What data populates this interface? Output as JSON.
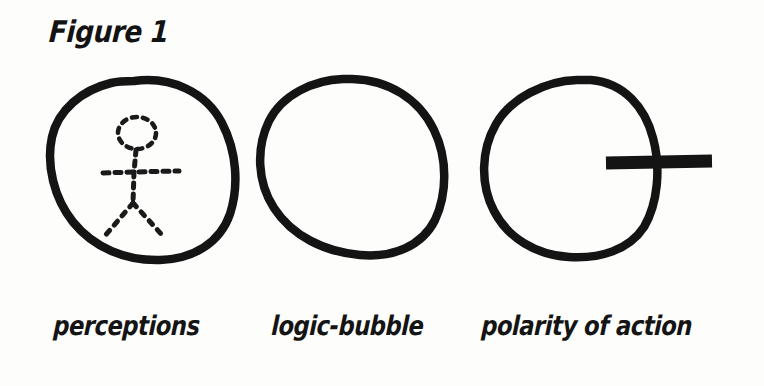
{
  "figure": {
    "title": "Figure 1",
    "background_color": "#fdfdfc",
    "ink_color": "#131313"
  },
  "panels": [
    {
      "id": "panel-perceptions",
      "caption": "perceptions",
      "shape": "hand-drawn-circle",
      "contents": "dotted-stick-figure"
    },
    {
      "id": "panel-logic-bubble",
      "caption": "logic-bubble",
      "shape": "hand-drawn-circle",
      "contents": "empty"
    },
    {
      "id": "panel-polarity-of-action",
      "caption": "polarity of action",
      "shape": "hand-drawn-circle",
      "contents": "horizontal-bar-crossing-right-edge"
    }
  ],
  "captions": {
    "first": "perceptions",
    "second": "logic-bubble",
    "third": "polarity of action"
  }
}
